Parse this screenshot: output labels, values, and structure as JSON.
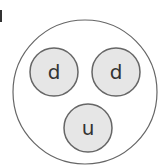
{
  "diagram": {
    "outer": {
      "cx": 85,
      "cy": 92,
      "r": 72,
      "stroke": "#666666",
      "fill": "#ffffff"
    },
    "quarks": [
      {
        "label": "d",
        "cx": 54,
        "cy": 72,
        "r": 24
      },
      {
        "label": "d",
        "cx": 116,
        "cy": 72,
        "r": 24
      },
      {
        "label": "u",
        "cx": 88,
        "cy": 128,
        "r": 24
      }
    ],
    "quark_fill": "#e6e6e6",
    "quark_stroke": "#666666"
  }
}
